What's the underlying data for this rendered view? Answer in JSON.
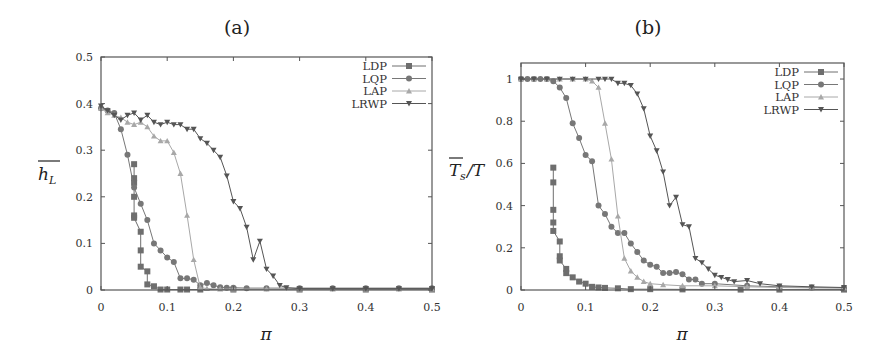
{
  "chart_data": [
    {
      "id": "a",
      "type": "line",
      "title": "(a)",
      "xlabel": "π",
      "ylabel": "h_L (overline)",
      "ylabel_display": {
        "main": "h",
        "sub": "L",
        "overline": true
      },
      "xlim": [
        0,
        0.5
      ],
      "ylim": [
        0,
        0.5
      ],
      "xticks": [
        0,
        0.1,
        0.2,
        0.3,
        0.4,
        0.5
      ],
      "xtick_labels": [
        "0",
        "0.1",
        "0.2",
        "0.3",
        "0.4",
        "0.5"
      ],
      "yticks": [
        0,
        0.1,
        0.2,
        0.3,
        0.4,
        0.5
      ],
      "ytick_labels": [
        "0",
        "0.1",
        "0.2",
        "0.3",
        "0.4",
        "0.5"
      ],
      "grid": false,
      "legend_position": "upper right",
      "frame": {
        "left": 101,
        "right": 432,
        "top": 57,
        "bottom": 290
      },
      "series": [
        {
          "name": "LDP",
          "marker": "square",
          "color": "#6e6e6e",
          "x": [
            0.05,
            0.05,
            0.05,
            0.05,
            0.05,
            0.05,
            0.06,
            0.06,
            0.06,
            0.07,
            0.07,
            0.08,
            0.09,
            0.1,
            0.12,
            0.13,
            0.15,
            0.2,
            0.3,
            0.4,
            0.5
          ],
          "y": [
            0.27,
            0.24,
            0.23,
            0.2,
            0.16,
            0.155,
            0.125,
            0.085,
            0.05,
            0.04,
            0.012,
            0.008,
            0.001,
            0.001,
            0.001,
            0.001,
            0.001,
            0.001,
            0.001,
            0.001,
            0.001
          ]
        },
        {
          "name": "LQP",
          "marker": "circle",
          "color": "#777777",
          "x": [
            0.0,
            0.01,
            0.02,
            0.03,
            0.04,
            0.05,
            0.06,
            0.07,
            0.08,
            0.09,
            0.1,
            0.11,
            0.12,
            0.13,
            0.14,
            0.15,
            0.16,
            0.17,
            0.18,
            0.19,
            0.2,
            0.22,
            0.25,
            0.3,
            0.35,
            0.4,
            0.45,
            0.5
          ],
          "y": [
            0.39,
            0.385,
            0.38,
            0.345,
            0.29,
            0.22,
            0.185,
            0.15,
            0.1,
            0.085,
            0.07,
            0.06,
            0.025,
            0.025,
            0.022,
            0.01,
            0.015,
            0.01,
            0.006,
            0.005,
            0.005,
            0.004,
            0.004,
            0.004,
            0.004,
            0.004,
            0.004,
            0.004
          ]
        },
        {
          "name": "LAP",
          "marker": "triangle-up",
          "color": "#a8a8a8",
          "x": [
            0.0,
            0.01,
            0.02,
            0.03,
            0.04,
            0.05,
            0.06,
            0.07,
            0.08,
            0.09,
            0.1,
            0.11,
            0.12,
            0.13,
            0.14,
            0.15,
            0.16,
            0.18,
            0.2,
            0.25,
            0.3,
            0.35,
            0.4,
            0.45,
            0.5
          ],
          "y": [
            0.39,
            0.38,
            0.375,
            0.37,
            0.36,
            0.355,
            0.36,
            0.35,
            0.33,
            0.32,
            0.32,
            0.295,
            0.25,
            0.16,
            0.065,
            0.005,
            0.003,
            0.002,
            0.002,
            0.002,
            0.002,
            0.002,
            0.002,
            0.002,
            0.002
          ]
        },
        {
          "name": "LRWP",
          "marker": "triangle-down",
          "color": "#555555",
          "x": [
            0.0,
            0.01,
            0.02,
            0.03,
            0.04,
            0.05,
            0.06,
            0.07,
            0.08,
            0.09,
            0.1,
            0.11,
            0.12,
            0.13,
            0.14,
            0.15,
            0.16,
            0.17,
            0.18,
            0.19,
            0.2,
            0.21,
            0.22,
            0.23,
            0.24,
            0.25,
            0.26,
            0.27,
            0.28,
            0.3,
            0.35,
            0.4,
            0.45,
            0.5
          ],
          "y": [
            0.395,
            0.385,
            0.375,
            0.365,
            0.375,
            0.38,
            0.365,
            0.375,
            0.36,
            0.355,
            0.36,
            0.355,
            0.355,
            0.345,
            0.345,
            0.325,
            0.315,
            0.3,
            0.285,
            0.245,
            0.19,
            0.175,
            0.135,
            0.065,
            0.105,
            0.045,
            0.03,
            0.01,
            0.005,
            0.003,
            0.003,
            0.003,
            0.003,
            0.003
          ]
        }
      ]
    },
    {
      "id": "b",
      "type": "line",
      "title": "(b)",
      "xlabel": "π",
      "ylabel": "T_s (overline) / T",
      "ylabel_display": {
        "main": "T",
        "sub": "s",
        "overline": true,
        "suffix": "/T"
      },
      "xlim": [
        0,
        0.5
      ],
      "ylim": [
        0,
        1.076
      ],
      "xticks": [
        0,
        0.1,
        0.2,
        0.3,
        0.4,
        0.5
      ],
      "xtick_labels": [
        "0",
        "0.1",
        "0.2",
        "0.3",
        "0.4",
        "0.5"
      ],
      "yticks": [
        0,
        0.2,
        0.4,
        0.6,
        0.8,
        1
      ],
      "ytick_labels": [
        "0",
        "0.2",
        "0.4",
        "0.6",
        "0.8",
        "1"
      ],
      "grid": false,
      "legend_position": "upper right",
      "frame": {
        "left": 521,
        "right": 844,
        "top": 63,
        "bottom": 290
      },
      "series": [
        {
          "name": "LDP",
          "marker": "square",
          "color": "#6e6e6e",
          "x": [
            0.05,
            0.05,
            0.05,
            0.05,
            0.05,
            0.06,
            0.06,
            0.06,
            0.07,
            0.07,
            0.08,
            0.09,
            0.1,
            0.11,
            0.12,
            0.13,
            0.15,
            0.17,
            0.2,
            0.25,
            0.34,
            0.4,
            0.5
          ],
          "y": [
            0.58,
            0.51,
            0.38,
            0.32,
            0.28,
            0.23,
            0.16,
            0.14,
            0.1,
            0.08,
            0.06,
            0.04,
            0.03,
            0.015,
            0.012,
            0.01,
            0.008,
            0.004,
            0.004,
            0.003,
            0.002,
            0.002,
            0.002
          ]
        },
        {
          "name": "LQP",
          "marker": "circle",
          "color": "#777777",
          "x": [
            0.0,
            0.01,
            0.02,
            0.03,
            0.04,
            0.05,
            0.06,
            0.07,
            0.08,
            0.09,
            0.1,
            0.11,
            0.12,
            0.13,
            0.14,
            0.15,
            0.16,
            0.17,
            0.18,
            0.19,
            0.2,
            0.21,
            0.22,
            0.23,
            0.24,
            0.25,
            0.26,
            0.27,
            0.28,
            0.3,
            0.35,
            0.4,
            0.45,
            0.5
          ],
          "y": [
            1.0,
            1.0,
            1.0,
            1.0,
            1.0,
            0.99,
            0.96,
            0.91,
            0.79,
            0.72,
            0.64,
            0.61,
            0.4,
            0.36,
            0.3,
            0.27,
            0.27,
            0.22,
            0.18,
            0.14,
            0.12,
            0.11,
            0.08,
            0.08,
            0.085,
            0.075,
            0.05,
            0.05,
            0.03,
            0.03,
            0.02,
            0.015,
            0.012,
            0.01
          ]
        },
        {
          "name": "LAP",
          "marker": "triangle-up",
          "color": "#a8a8a8",
          "x": [
            0.0,
            0.02,
            0.04,
            0.06,
            0.08,
            0.1,
            0.11,
            0.12,
            0.13,
            0.14,
            0.15,
            0.16,
            0.17,
            0.18,
            0.19,
            0.2,
            0.22,
            0.25,
            0.3,
            0.35,
            0.4,
            0.45,
            0.5
          ],
          "y": [
            1.0,
            1.0,
            1.0,
            1.0,
            1.0,
            1.0,
            0.99,
            0.96,
            0.79,
            0.62,
            0.35,
            0.15,
            0.09,
            0.06,
            0.04,
            0.03,
            0.025,
            0.02,
            0.02,
            0.015,
            0.012,
            0.01,
            0.01
          ]
        },
        {
          "name": "LRWP",
          "marker": "triangle-down",
          "color": "#555555",
          "x": [
            0.0,
            0.02,
            0.04,
            0.06,
            0.08,
            0.1,
            0.12,
            0.13,
            0.14,
            0.15,
            0.16,
            0.17,
            0.18,
            0.19,
            0.2,
            0.21,
            0.22,
            0.23,
            0.24,
            0.25,
            0.26,
            0.27,
            0.28,
            0.29,
            0.3,
            0.31,
            0.32,
            0.33,
            0.35,
            0.37,
            0.4,
            0.45,
            0.5
          ],
          "y": [
            1.0,
            1.0,
            1.0,
            1.0,
            1.0,
            1.0,
            1.0,
            1.0,
            1.0,
            0.98,
            0.98,
            0.97,
            0.93,
            0.86,
            0.73,
            0.66,
            0.56,
            0.4,
            0.44,
            0.31,
            0.3,
            0.15,
            0.13,
            0.1,
            0.07,
            0.06,
            0.05,
            0.04,
            0.045,
            0.03,
            0.02,
            0.015,
            0.012
          ]
        }
      ]
    }
  ],
  "figure": {
    "panels": [
      {
        "title": "(a)",
        "xlabel": "π"
      },
      {
        "title": "(b)",
        "xlabel": "π"
      }
    ],
    "legend_labels": [
      "LDP",
      "LQP",
      "LAP",
      "LRWP"
    ]
  }
}
